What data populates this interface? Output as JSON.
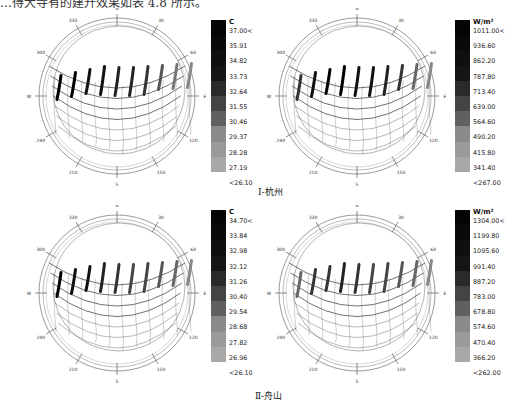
{
  "top_text": "…得大寺有的建升效果如表 4.8 所示。",
  "groups": [
    {
      "caption": "Ⅰ-杭州"
    },
    {
      "caption": "Ⅱ-舟山"
    }
  ],
  "dial_labels": {
    "N": "N",
    "S": "S",
    "E": "E",
    "W": "W",
    "a30": "30",
    "a60": "60",
    "a120": "120",
    "a150": "150",
    "a210": "210",
    "a240": "240",
    "a300": "300",
    "a330": "330"
  },
  "legends": [
    {
      "unit": "C",
      "ticks": [
        "37.00<",
        "35.91",
        "34.82",
        "33.73",
        "32.64",
        "31.55",
        "30.46",
        "29.37",
        "28.28",
        "27.19",
        "<26.10"
      ]
    },
    {
      "unit": "W/m²",
      "ticks": [
        "1011.00<",
        "936.60",
        "862.20",
        "787.80",
        "713.40",
        "639.00",
        "564.60",
        "490.20",
        "415.80",
        "341.40",
        "<267.00"
      ]
    },
    {
      "unit": "C",
      "ticks": [
        "34.70<",
        "33.84",
        "32.98",
        "32.12",
        "31.26",
        "30.40",
        "29.54",
        "28.68",
        "27.82",
        "26.96",
        "<26.10"
      ]
    },
    {
      "unit": "W/m²",
      "ticks": [
        "1304.00<",
        "1199.80",
        "1095.60",
        "991.40",
        "887.20",
        "783.00",
        "678.80",
        "574.60",
        "470.40",
        "366.20",
        "<262.00"
      ]
    }
  ],
  "chart_data": [
    {
      "type": "heatmap",
      "title": "Ⅰ-杭州 temperature sun-path",
      "legend_unit": "C",
      "scale": [
        37.0,
        35.91,
        34.82,
        33.73,
        32.64,
        31.55,
        30.46,
        29.37,
        28.28,
        27.19,
        26.1
      ],
      "axis_labels": [
        "N",
        "30",
        "60",
        "E",
        "120",
        "150",
        "S",
        "210",
        "240",
        "W",
        "300",
        "330"
      ]
    },
    {
      "type": "heatmap",
      "title": "Ⅰ-杭州 solar radiation sun-path",
      "legend_unit": "W/m²",
      "scale": [
        1011.0,
        936.6,
        862.2,
        787.8,
        713.4,
        639.0,
        564.6,
        490.2,
        415.8,
        341.4,
        267.0
      ],
      "axis_labels": [
        "N",
        "30",
        "60",
        "E",
        "120",
        "150",
        "S",
        "210",
        "240",
        "W",
        "300",
        "330"
      ]
    },
    {
      "type": "heatmap",
      "title": "Ⅱ-舟山 temperature sun-path",
      "legend_unit": "C",
      "scale": [
        34.7,
        33.84,
        32.98,
        32.12,
        31.26,
        30.4,
        29.54,
        28.68,
        27.82,
        26.96,
        26.1
      ],
      "axis_labels": [
        "N",
        "30",
        "60",
        "E",
        "120",
        "150",
        "S",
        "210",
        "240",
        "W",
        "300",
        "330"
      ]
    },
    {
      "type": "heatmap",
      "title": "Ⅱ-舟山 solar radiation sun-path",
      "legend_unit": "W/m²",
      "scale": [
        1304.0,
        1199.8,
        1095.6,
        991.4,
        887.2,
        783.0,
        678.8,
        574.6,
        470.4,
        366.2,
        262.0
      ],
      "axis_labels": [
        "N",
        "30",
        "60",
        "E",
        "120",
        "150",
        "S",
        "210",
        "240",
        "W",
        "300",
        "330"
      ]
    }
  ]
}
